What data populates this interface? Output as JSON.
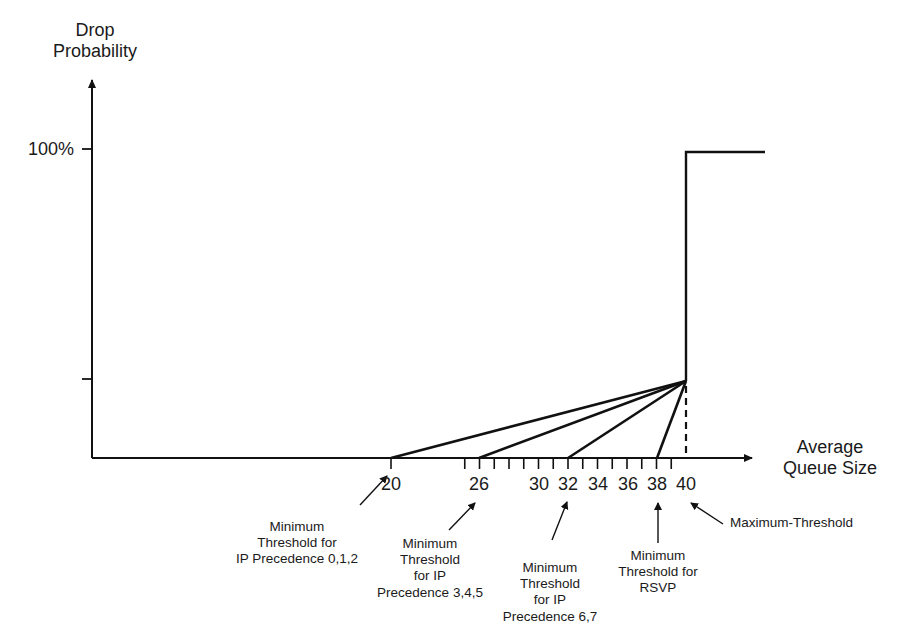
{
  "diagram": {
    "y_axis": {
      "label": "Drop\nProbability",
      "ticks": [
        {
          "label": "100%",
          "value": 1.0
        },
        {
          "label": "",
          "value": 0.25
        }
      ]
    },
    "x_axis": {
      "label": "Average\nQueue Size",
      "tick_labels": [
        {
          "value": 20,
          "label": "20"
        },
        {
          "value": 26,
          "label": "26"
        },
        {
          "value": 30,
          "label": "30"
        },
        {
          "value": 32,
          "label": "32"
        },
        {
          "value": 34,
          "label": "34"
        },
        {
          "value": 36,
          "label": "36"
        },
        {
          "value": 38,
          "label": "38"
        },
        {
          "value": 40,
          "label": "40"
        }
      ],
      "minor_ticks_from": 25,
      "minor_ticks_to": 39
    },
    "annotations": [
      {
        "id": "prec-012",
        "text": "Minimum\nThreshold for\nIP Precedence 0,1,2",
        "points_to": 20
      },
      {
        "id": "prec-345",
        "text": "Minimum\nThreshold\nfor IP\nPrecedence 3,4,5",
        "points_to": 26
      },
      {
        "id": "prec-67",
        "text": "Minimum\nThreshold\nfor IP\nPrecedence 6,7",
        "points_to": 32
      },
      {
        "id": "rsvp",
        "text": "Minimum\nThreshold for\nRSVP",
        "points_to": 38
      },
      {
        "id": "max",
        "text": "Maximum-Threshold",
        "points_to": 40
      }
    ],
    "colors": {
      "line": "#111111",
      "text": "#1a1a1a",
      "background": "#ffffff"
    }
  },
  "chart_data": {
    "type": "line",
    "title": "",
    "xlabel": "Average Queue Size",
    "ylabel": "Drop Probability",
    "y_tick_labels": [
      "100%"
    ],
    "x_tick_labels": [
      "20",
      "26",
      "30",
      "32",
      "34",
      "36",
      "38",
      "40"
    ],
    "grid": false,
    "legend": "none",
    "series": [
      {
        "name": "IP Precedence 0,1,2",
        "x": [
          0,
          20,
          40,
          40,
          45
        ],
        "y": [
          0,
          0,
          0.25,
          1.0,
          1.0
        ]
      },
      {
        "name": "IP Precedence 3,4,5",
        "x": [
          0,
          26,
          40,
          40,
          45
        ],
        "y": [
          0,
          0,
          0.25,
          1.0,
          1.0
        ]
      },
      {
        "name": "IP Precedence 6,7",
        "x": [
          0,
          32,
          40,
          40,
          45
        ],
        "y": [
          0,
          0,
          0.25,
          1.0,
          1.0
        ]
      },
      {
        "name": "RSVP",
        "x": [
          0,
          38,
          40,
          40,
          45
        ],
        "y": [
          0,
          0,
          0.25,
          1.0,
          1.0
        ]
      }
    ],
    "minimum_thresholds": {
      "IP Precedence 0,1,2": 20,
      "IP Precedence 3,4,5": 26,
      "IP Precedence 6,7": 32,
      "RSVP": 38
    },
    "maximum_threshold": 40,
    "mark_probability_at_max": "unlabeled tick (approx. 25% of axis height)",
    "max_probability": "100%"
  }
}
